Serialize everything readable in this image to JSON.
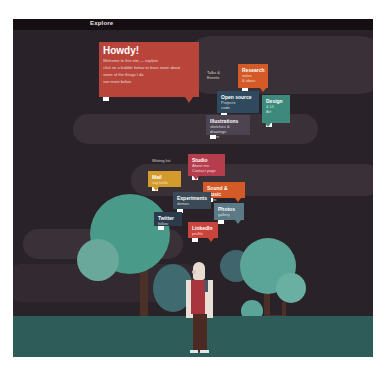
{
  "window": {
    "title": "Explore"
  },
  "colors": {
    "background": "#2a2229",
    "cloud": "#3a3138",
    "ground": "#2e5c58",
    "tree_teal": "#4a9a8a",
    "tree_light": "#5fa89a",
    "tree_slate": "#3f6a70",
    "trunk": "#4a3026"
  },
  "bubbles": [
    {
      "id": "howdy",
      "title": "Howdy!",
      "lines": [
        "Welcome to this site — explore",
        "click on a bubble below to learn more about",
        "some of the things I do",
        "see more below"
      ],
      "color": "#b8443a"
    },
    {
      "id": "orange-top",
      "title": "Research",
      "lines": [
        "notes",
        "& ideas"
      ],
      "color": "#d45a28"
    },
    {
      "id": "label-top",
      "title": "",
      "lines": [
        "Talks &",
        "Events"
      ],
      "color": "transparent"
    },
    {
      "id": "navy",
      "title": "Open source",
      "lines": [
        "Projects",
        "code"
      ],
      "color": "#2f4a5e"
    },
    {
      "id": "teal-right",
      "title": "Design",
      "lines": [
        "& UI",
        "Art"
      ],
      "color": "#3d8a7c"
    },
    {
      "id": "slate-mid",
      "title": "Illustrations",
      "lines": [
        "sketches & drawings",
        "more"
      ],
      "color": "#4d4452"
    },
    {
      "id": "label-mid",
      "title": "",
      "lines": [
        "Writing list"
      ],
      "color": "transparent"
    },
    {
      "id": "crimson",
      "title": "Studio",
      "lines": [
        "About me",
        "Contact page"
      ],
      "color": "#b63d4e"
    },
    {
      "id": "mustard",
      "title": "Mail",
      "lines": [
        "say hello"
      ],
      "color": "#d39a2c"
    },
    {
      "id": "orange-mid",
      "title": "Sound & Music",
      "lines": [
        "listen"
      ],
      "color": "#d45a28"
    },
    {
      "id": "slate-left",
      "title": "Experiments",
      "lines": [
        "demos"
      ],
      "color": "#3c4a58"
    },
    {
      "id": "grey-blue",
      "title": "Photos",
      "lines": [
        "gallery"
      ],
      "color": "#5c7a86"
    },
    {
      "id": "dark-navy",
      "title": "Twitter",
      "lines": [
        "follow"
      ],
      "color": "#2b3b4c"
    },
    {
      "id": "red-bottom",
      "title": "LinkedIn",
      "lines": [
        "profile"
      ],
      "color": "#c9443a"
    }
  ],
  "character": {
    "description": "bald figure in red shirt and dark brown pants standing between trees"
  }
}
